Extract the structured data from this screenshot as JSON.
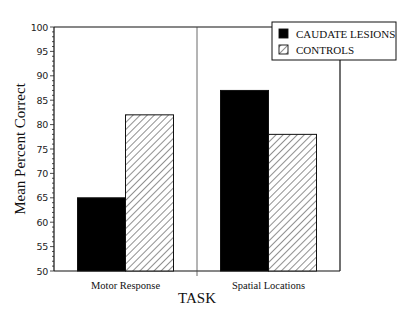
{
  "chart_data": {
    "type": "bar",
    "title": "",
    "xlabel": "TASK",
    "ylabel": "Mean Percent Correct",
    "ylim": [
      50,
      100
    ],
    "yticks": [
      50,
      55,
      60,
      65,
      70,
      75,
      80,
      85,
      90,
      95,
      100
    ],
    "grid": false,
    "legend_position": "top-right",
    "categories": [
      "Motor Response",
      "Spatial Locations"
    ],
    "series": [
      {
        "name": "CAUDATE LESIONS",
        "fill": "solid",
        "color": "#000000",
        "values": [
          65,
          87
        ]
      },
      {
        "name": "CONTROLS",
        "fill": "diagonal-hatch",
        "color": "#ffffff",
        "values": [
          82,
          78
        ]
      }
    ]
  },
  "legend": {
    "items": [
      {
        "label": "CAUDATE LESIONS",
        "swatch": "solid"
      },
      {
        "label": "CONTROLS",
        "swatch": "hatch"
      }
    ]
  }
}
